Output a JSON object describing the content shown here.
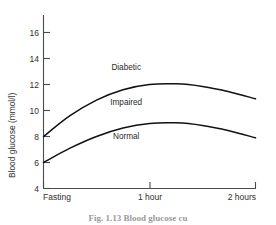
{
  "figure": {
    "caption": "Fig. 1.13  Blood glucose curves",
    "caption_visible_fragment": "Fig. 1.13  Blood glucose cu"
  },
  "chart_data": {
    "type": "line",
    "title": "",
    "xlabel": "",
    "ylabel": "Blood glucose (mmol/l)",
    "ylim": [
      4,
      17
    ],
    "xlim": [
      0,
      2
    ],
    "grid": false,
    "legend": "inline-annotations",
    "y_ticks": [
      16,
      14,
      12,
      10,
      8,
      6,
      4
    ],
    "y_tick_labels": [
      "16",
      "14",
      "12",
      "10",
      "8",
      "6",
      "4"
    ],
    "x_ticks": [
      0,
      1,
      2
    ],
    "x_tick_labels": [
      "Fasting",
      "1 hour",
      "2 hours"
    ],
    "annotations": [
      {
        "text": "Diabetic",
        "x": 0.78,
        "y": 13.1
      },
      {
        "text": "Impaired",
        "x": 0.78,
        "y": 10.4
      },
      {
        "text": "Normal",
        "x": 0.78,
        "y": 7.8
      }
    ],
    "series": [
      {
        "name": "Diabetic threshold curve",
        "x": [
          0.0,
          0.25,
          0.5,
          0.75,
          1.0,
          1.25,
          1.5,
          1.75,
          2.0
        ],
        "values": [
          8.0,
          9.6,
          10.8,
          11.6,
          12.0,
          12.05,
          11.85,
          11.45,
          10.9
        ]
      },
      {
        "name": "Normal upper limit curve",
        "x": [
          0.0,
          0.25,
          0.5,
          0.75,
          1.0,
          1.25,
          1.5,
          1.75,
          2.0
        ],
        "values": [
          6.0,
          7.1,
          8.0,
          8.65,
          9.0,
          9.05,
          8.85,
          8.45,
          7.9
        ]
      }
    ]
  },
  "axis_titles": {
    "y": "Blood glucose (mmol/l)"
  }
}
